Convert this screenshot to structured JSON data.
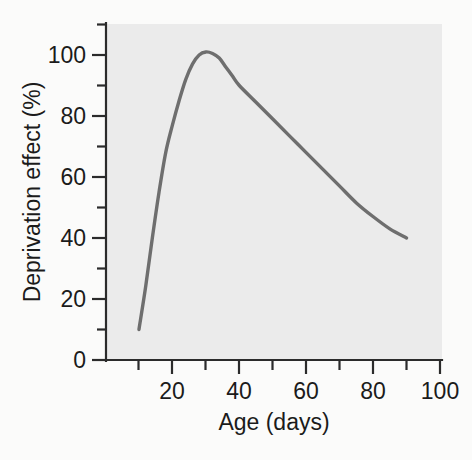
{
  "chart_data": {
    "type": "line",
    "title": "",
    "xlabel": "Age (days)",
    "ylabel": "Deprivation effect (%)",
    "xlim": [
      0,
      100
    ],
    "ylim": [
      0,
      110
    ],
    "grid": false,
    "legend": "none",
    "x_major_ticks": [
      20,
      40,
      60,
      80,
      100
    ],
    "x_major_tick_labels": [
      "20",
      "40",
      "60",
      "80",
      "100"
    ],
    "x_minor_ticks": [
      10,
      30,
      50,
      70,
      90
    ],
    "y_major_ticks": [
      0,
      20,
      40,
      60,
      80,
      100
    ],
    "y_major_tick_labels": [
      "0",
      "20",
      "40",
      "60",
      "80",
      "100"
    ],
    "y_minor_ticks": [
      10,
      30,
      50,
      70,
      90,
      110
    ],
    "series": [
      {
        "name": "Deprivation effect",
        "color": "#6e6e6e",
        "x": [
          10,
          12,
          14,
          16,
          18,
          20,
          22,
          24,
          26,
          28,
          30,
          32,
          34,
          36,
          38,
          40,
          45,
          50,
          55,
          60,
          65,
          70,
          75,
          80,
          85,
          90
        ],
        "values": [
          10,
          24,
          40,
          55,
          68,
          77,
          85,
          92,
          97,
          100,
          101,
          100.5,
          99,
          96,
          93,
          90,
          84.5,
          79,
          73.5,
          68,
          62.5,
          57,
          51.5,
          47,
          43,
          40
        ]
      }
    ]
  },
  "axes": {
    "y_axis_label": "Deprivation effect (%)",
    "x_axis_label": "Age (days)"
  },
  "colors": {
    "page_background": "#fbfbfa",
    "plot_background": "#ebebeb",
    "curve": "#6e6e6e",
    "axis": "#2b2b2b",
    "text": "#1b1b1b"
  }
}
